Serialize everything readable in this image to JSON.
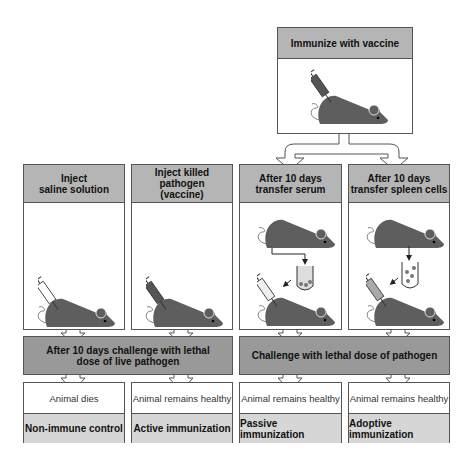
{
  "top": {
    "title": "Immunize with vaccine"
  },
  "columns": [
    {
      "title": "Inject\nsaline solution"
    },
    {
      "title": "Inject killed pathogen\n(vaccine)"
    },
    {
      "title": "After 10 days\ntransfer serum"
    },
    {
      "title": "After 10 days\ntransfer spleen cells"
    }
  ],
  "challenges": [
    {
      "text": "After 10 days challenge with lethal\ndose of live pathogen"
    },
    {
      "text": "Challenge with lethal dose of pathogen"
    }
  ],
  "results": [
    {
      "outcome": "Animal dies",
      "label": "Non-immune control"
    },
    {
      "outcome": "Animal remains healthy",
      "label": "Active immunization"
    },
    {
      "outcome": "Animal remains healthy",
      "label": "Passive immunization"
    },
    {
      "outcome": "Animal remains healthy",
      "label": "Adoptive immunization"
    }
  ],
  "colors": {
    "header": "#b5b5b5",
    "bar": "#999999",
    "label": "#d6d6d6",
    "mouse": "#5e5e5e"
  }
}
